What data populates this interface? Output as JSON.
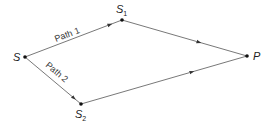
{
  "diagram": {
    "type": "path-diagram",
    "nodes": [
      {
        "id": "S",
        "label": "S",
        "sub": "",
        "x": 25,
        "y": 57
      },
      {
        "id": "S1",
        "label": "S",
        "sub": "1",
        "x": 122,
        "y": 20
      },
      {
        "id": "P",
        "label": "P",
        "sub": "",
        "x": 247,
        "y": 56
      },
      {
        "id": "S2",
        "label": "S",
        "sub": "2",
        "x": 81,
        "y": 104
      }
    ],
    "edges": [
      {
        "from": "S",
        "to": "S1",
        "label": "Path 1"
      },
      {
        "from": "S1",
        "to": "P",
        "label": ""
      },
      {
        "from": "S",
        "to": "S2",
        "label": "Path 2"
      },
      {
        "from": "S2",
        "to": "P",
        "label": ""
      }
    ],
    "labels": {
      "S": "S",
      "S1_main": "S",
      "S1_sub": "1",
      "P": "P",
      "S2_main": "S",
      "S2_sub": "2",
      "path1": "Path 1",
      "path2": "Path 2"
    },
    "colors": {
      "line": "#444444",
      "dot": "#111111",
      "text": "#222222"
    }
  }
}
